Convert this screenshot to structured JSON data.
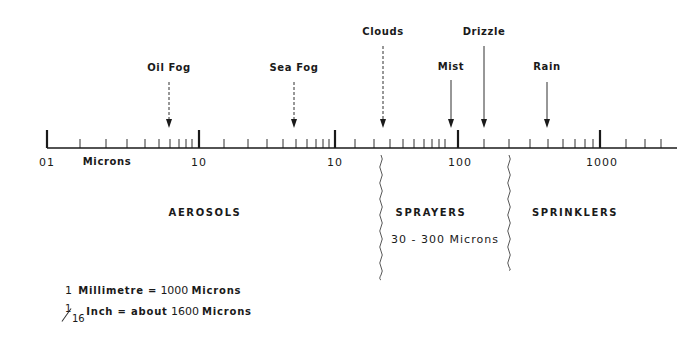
{
  "diagram": {
    "axis_unit_label": "Microns",
    "scale": {
      "major_ticks": [
        {
          "label": "01",
          "x": 47
        },
        {
          "label": "10",
          "x": 199
        },
        {
          "label": "10",
          "x": 335
        },
        {
          "label": "100",
          "x": 458
        },
        {
          "label": "1000",
          "x": 600
        }
      ],
      "minor_tick_x": [
        80,
        106,
        127,
        145,
        159,
        170,
        179,
        186,
        192,
        224,
        248,
        267,
        283,
        296,
        307,
        316,
        323,
        329,
        355,
        374,
        390,
        403,
        414,
        424,
        432,
        439,
        445,
        484,
        509,
        530,
        548,
        563,
        575,
        585,
        593,
        626,
        645,
        661
      ],
      "axis_start_x": 47,
      "axis_end_x": 677,
      "axis_y": 148
    },
    "arrows": [
      {
        "label": "Oil Fog",
        "x": 169,
        "label_y": 62,
        "top": 82,
        "style": "dashed"
      },
      {
        "label": "Sea Fog",
        "x": 294,
        "label_y": 62,
        "top": 82,
        "style": "dashed"
      },
      {
        "label": "Clouds",
        "x": 383,
        "label_y": 26,
        "top": 46,
        "style": "dashed"
      },
      {
        "label": "Mist",
        "x": 451,
        "label_y": 61,
        "top": 80,
        "style": "solid"
      },
      {
        "label": "Drizzle",
        "x": 484,
        "label_y": 26,
        "top": 46,
        "style": "solid"
      },
      {
        "label": "Rain",
        "x": 547,
        "label_y": 61,
        "top": 82,
        "style": "solid"
      }
    ],
    "regions": [
      {
        "label": "AEROSOLS",
        "x": 205,
        "y": 207
      },
      {
        "label": "SPRAYERS",
        "x": 431,
        "y": 207
      },
      {
        "label": "SPRINKLERS",
        "x": 575,
        "y": 207
      }
    ],
    "sprayers_range": "30 - 300 Microns",
    "dividers": [
      {
        "x": 381,
        "top": 155,
        "bottom": 280
      },
      {
        "x": 509,
        "top": 155,
        "bottom": 270
      }
    ],
    "notes": {
      "line1_prefix": "1",
      "line1_text": "Millimetre =",
      "line1_value": "1000",
      "line1_unit": "Microns",
      "line2_frac_num": "1",
      "line2_frac_den": "16",
      "line2_text": "Inch = about",
      "line2_value": "1600",
      "line2_unit": "Microns"
    },
    "colors": {
      "ink": "#1a1a1a",
      "background": "#ffffff"
    }
  }
}
